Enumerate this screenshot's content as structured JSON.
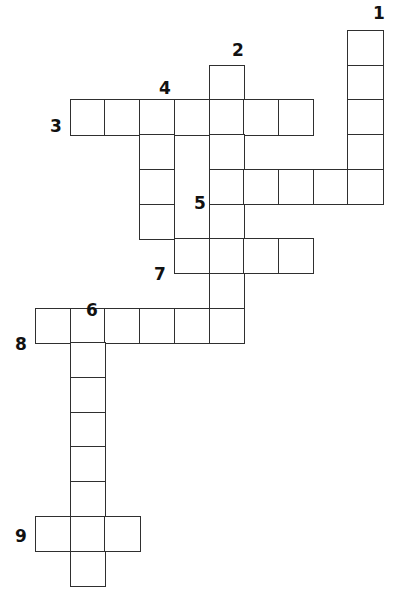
{
  "puzzle": {
    "title": "Crossword Puzzle Grid",
    "cell_size": 34.7,
    "origin_x": 35.0,
    "origin_y": 30.0,
    "grid_columns": 11,
    "grid_rows": 16,
    "cell_fill_color": "#ffffff",
    "cell_border_color": "#2f2f2f",
    "number_color": "#111111",
    "background_color": "#ffffff",
    "entries": [
      {
        "number": "1",
        "direction": "down",
        "col": 9,
        "row": 0,
        "length": 5
      },
      {
        "number": "2",
        "direction": "down",
        "col": 5,
        "row": 1,
        "length": 9
      },
      {
        "number": "3",
        "direction": "across",
        "col": 1,
        "row": 2,
        "length": 7
      },
      {
        "number": "4",
        "direction": "down",
        "col": 3,
        "row": 2,
        "length": 5
      },
      {
        "number": "5",
        "direction": "across",
        "col": 5,
        "row": 4,
        "length": 5
      },
      {
        "number": "6",
        "direction": "down",
        "col": 1,
        "row": 8,
        "length": 8
      },
      {
        "number": "7",
        "direction": "across",
        "col": 4,
        "row": 6,
        "length": 4
      },
      {
        "number": "8",
        "direction": "across",
        "col": 0,
        "row": 8,
        "length": 6
      },
      {
        "number": "9",
        "direction": "across",
        "col": 0,
        "row": 14,
        "length": 3
      }
    ],
    "cells": [
      {
        "col": 9,
        "row": 0
      },
      {
        "col": 9,
        "row": 1
      },
      {
        "col": 5,
        "row": 1
      },
      {
        "col": 1,
        "row": 2
      },
      {
        "col": 2,
        "row": 2
      },
      {
        "col": 3,
        "row": 2
      },
      {
        "col": 4,
        "row": 2
      },
      {
        "col": 5,
        "row": 2
      },
      {
        "col": 6,
        "row": 2
      },
      {
        "col": 7,
        "row": 2
      },
      {
        "col": 9,
        "row": 2
      },
      {
        "col": 3,
        "row": 3
      },
      {
        "col": 5,
        "row": 3
      },
      {
        "col": 9,
        "row": 3
      },
      {
        "col": 3,
        "row": 4
      },
      {
        "col": 5,
        "row": 4
      },
      {
        "col": 6,
        "row": 4
      },
      {
        "col": 7,
        "row": 4
      },
      {
        "col": 8,
        "row": 4
      },
      {
        "col": 9,
        "row": 4
      },
      {
        "col": 3,
        "row": 5
      },
      {
        "col": 5,
        "row": 5
      },
      {
        "col": 4,
        "row": 6
      },
      {
        "col": 5,
        "row": 6
      },
      {
        "col": 6,
        "row": 6
      },
      {
        "col": 7,
        "row": 6
      },
      {
        "col": 5,
        "row": 7
      },
      {
        "col": 0,
        "row": 8
      },
      {
        "col": 1,
        "row": 8
      },
      {
        "col": 2,
        "row": 8
      },
      {
        "col": 3,
        "row": 8
      },
      {
        "col": 4,
        "row": 8
      },
      {
        "col": 5,
        "row": 8
      },
      {
        "col": 1,
        "row": 9
      },
      {
        "col": 1,
        "row": 10
      },
      {
        "col": 1,
        "row": 11
      },
      {
        "col": 1,
        "row": 12
      },
      {
        "col": 1,
        "row": 13
      },
      {
        "col": 0,
        "row": 14
      },
      {
        "col": 1,
        "row": 14
      },
      {
        "col": 2,
        "row": 14
      },
      {
        "col": 1,
        "row": 15
      }
    ],
    "labels": [
      {
        "text": "1",
        "x": 369,
        "y": 5,
        "name": "clue-number-1"
      },
      {
        "text": "2",
        "x": 228,
        "y": 42,
        "name": "clue-number-2"
      },
      {
        "text": "3",
        "x": 46,
        "y": 118,
        "name": "clue-number-3"
      },
      {
        "text": "4",
        "x": 155,
        "y": 80,
        "name": "clue-number-4"
      },
      {
        "text": "5",
        "x": 190,
        "y": 195,
        "name": "clue-number-5"
      },
      {
        "text": "6",
        "x": 82,
        "y": 302,
        "name": "clue-number-6"
      },
      {
        "text": "7",
        "x": 150,
        "y": 266,
        "name": "clue-number-7"
      },
      {
        "text": "8",
        "x": 11,
        "y": 336,
        "name": "clue-number-8"
      },
      {
        "text": "9",
        "x": 11,
        "y": 528,
        "name": "clue-number-9"
      }
    ]
  }
}
